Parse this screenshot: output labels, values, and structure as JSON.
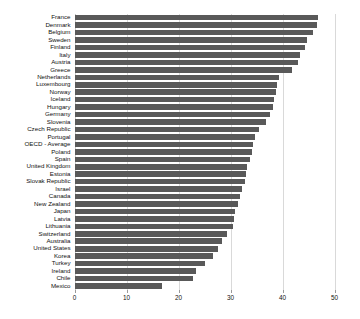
{
  "chart_data": {
    "type": "bar",
    "orientation": "horizontal",
    "title": "",
    "xlabel": "",
    "ylabel": "",
    "xlim": [
      0,
      50
    ],
    "xticks": [
      0,
      10,
      20,
      30,
      40,
      50
    ],
    "xtick_labels": [
      "0",
      "10",
      "20",
      "30",
      "40",
      "50"
    ],
    "grid": true,
    "grid_axis": "x",
    "legend": false,
    "bar_color": "#595959",
    "categories": [
      "France",
      "Denmark",
      "Belgium",
      "Sweden",
      "Finland",
      "Italy",
      "Austria",
      "Greece",
      "Netherlands",
      "Luxembourg",
      "Norway",
      "Iceland",
      "Hungary",
      "Germany",
      "Slovenia",
      "Czech Republic",
      "Portugal",
      "OECD - Average",
      "Poland",
      "Spain",
      "United Kingdom",
      "Estonia",
      "Slovak Republic",
      "Israel",
      "Canada",
      "New Zealand",
      "Japan",
      "Latvia",
      "Lithuania",
      "Switzerland",
      "Australia",
      "United States",
      "Korea",
      "Turkey",
      "Ireland",
      "Chile",
      "Mexico"
    ],
    "values": [
      46.9,
      46.6,
      45.9,
      44.8,
      44.4,
      43.3,
      42.9,
      41.8,
      39.4,
      39.0,
      38.7,
      38.4,
      38.1,
      37.6,
      36.9,
      35.4,
      34.7,
      34.4,
      34.1,
      33.8,
      33.2,
      33.0,
      32.7,
      32.2,
      31.9,
      31.5,
      30.9,
      30.6,
      30.4,
      29.4,
      28.3,
      27.6,
      26.6,
      25.0,
      23.3,
      22.8,
      16.8
    ]
  }
}
